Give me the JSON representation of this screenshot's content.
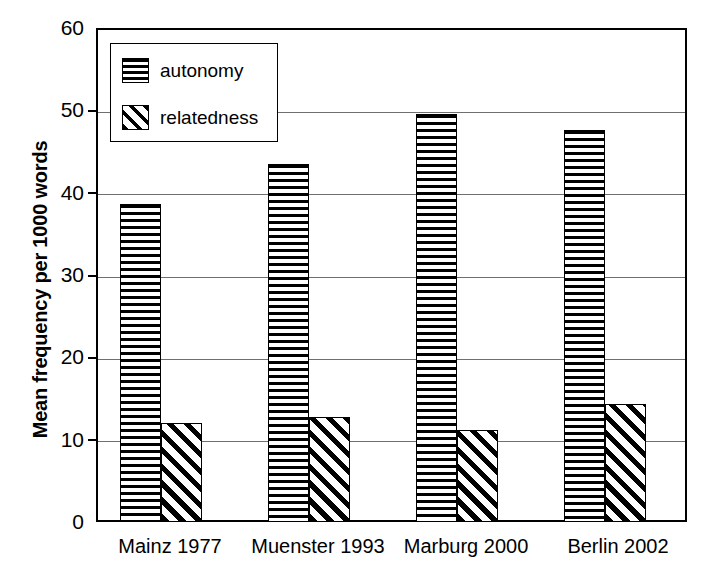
{
  "chart_data": {
    "type": "bar",
    "title": "",
    "subtitle": "",
    "xlabel": "",
    "ylabel": "Mean frequency per 1000 words",
    "categories": [
      "Mainz 1977",
      "Muenster 1993",
      "Marburg 2000",
      "Berlin 2002"
    ],
    "series": [
      {
        "name": "autonomy",
        "values": [
          38.6,
          43.5,
          49.5,
          47.6
        ]
      },
      {
        "name": "relatedness",
        "values": [
          12.0,
          12.7,
          11.2,
          14.3
        ]
      }
    ],
    "ylim": [
      0,
      60
    ],
    "yticks": [
      0,
      10,
      20,
      30,
      40,
      50,
      60
    ],
    "ytick_labels": [
      "0",
      "10",
      "20",
      "30",
      "40",
      "50",
      "60"
    ],
    "grid": "horizontal",
    "legend_position": "top-left",
    "legend_entries": [
      "autonomy",
      "relatedness"
    ],
    "patterns": {
      "autonomy": "horizontal-stripes",
      "relatedness": "diagonal-stripes"
    },
    "colors": {
      "foreground": "#000000",
      "background": "#ffffff",
      "gridline": "#6f6f6f"
    }
  }
}
